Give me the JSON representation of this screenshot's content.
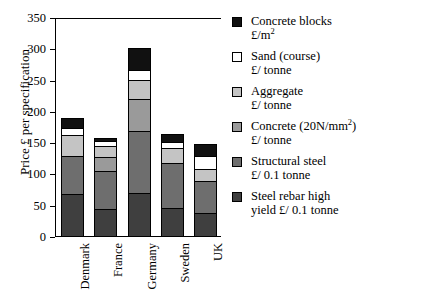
{
  "chart_data": {
    "type": "bar",
    "subtype": "stacked-vertical",
    "title": "",
    "xlabel": "",
    "ylabel": "Price £ per specification",
    "ylim": [
      0,
      350
    ],
    "yticks": [
      0,
      50,
      100,
      150,
      200,
      250,
      300,
      350
    ],
    "grid": false,
    "legend_position": "right",
    "categories": [
      "Denmark",
      "France",
      "Germany",
      "Sweden",
      "UK"
    ],
    "series": [
      {
        "name": "Steel rebar high yield £/ 0.1 tonne",
        "legend_line1": "Steel rebar high",
        "legend_line2": "yield £/ 0.1 tonne",
        "color": "#3f3f3f",
        "values": [
          69,
          44,
          70,
          47,
          38
        ]
      },
      {
        "name": "Structural steel £/ 0.1 tonne",
        "legend_line1": "Structural steel",
        "legend_line2": "£/ 0.1 tonne",
        "color": "#6e6e6e",
        "values": [
          60,
          62,
          100,
          71,
          52
        ]
      },
      {
        "name": "Concrete (20N/mm2) £/ tonne",
        "legend_line1": "Concrete (20N/mm²)",
        "legend_line2": "£/ tonne",
        "color": "#9a9a9a",
        "values": [
          0,
          22,
          51,
          0,
          0
        ]
      },
      {
        "name": "Aggregate £/ tonne",
        "legend_line1": "Aggregate",
        "legend_line2": "£/ tonne",
        "color": "#c4c4c4",
        "values": [
          34,
          17,
          30,
          24,
          18
        ]
      },
      {
        "name": "Sand (course) £/ tonne",
        "legend_line1": "Sand (course)",
        "legend_line2": "£/ tonne",
        "color": "#ffffff",
        "values": [
          12,
          8,
          16,
          10,
          22
        ]
      },
      {
        "name": "Concrete blocks £/m2",
        "legend_line1": "Concrete blocks",
        "legend_line2": "£/m²",
        "color": "#111111",
        "values": [
          16,
          5,
          35,
          13,
          18
        ]
      }
    ],
    "totals": [
      191,
      158,
      302,
      165,
      148
    ]
  }
}
